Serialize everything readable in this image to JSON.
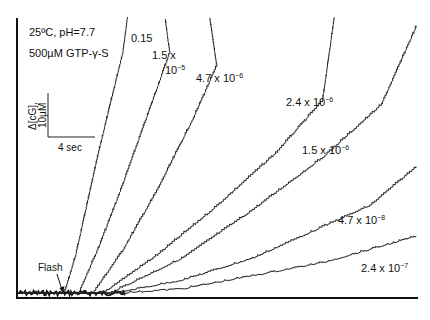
{
  "chart_data": {
    "type": "line",
    "title": "",
    "annotations": {
      "conditions_line1": "25ºC, pH=7.7",
      "conditions_line2": "500µM GTP-γ-S",
      "flash_label": "Flash",
      "scale_y_label_line1": "Δ[cG],",
      "scale_y_label_line2": "10µM",
      "scale_x_label": "4 sec"
    },
    "scale_bar": {
      "time_s": 4,
      "conc_uM": 10
    },
    "xlabel": "",
    "ylabel": "",
    "x_unit": "s",
    "y_unit": "µM",
    "xlim": [
      0,
      34
    ],
    "ylim": [
      0,
      63
    ],
    "flash_time": 3.8,
    "grid": false,
    "legend": "inline labels",
    "series": [
      {
        "name": "0.15",
        "label": "0.15",
        "label_sup": "",
        "start_time": 4.0,
        "points": [
          [
            4.0,
            0
          ],
          [
            5.0,
            9
          ],
          [
            6.0,
            21
          ],
          [
            7.0,
            33
          ],
          [
            8.0,
            44
          ],
          [
            9.0,
            55
          ],
          [
            9.4,
            63
          ]
        ]
      },
      {
        "name": "1.5 x 10^-5",
        "label": "1.5 x",
        "label2": "10",
        "label_sup": "−5",
        "start_time": 5.2,
        "points": [
          [
            5.2,
            0
          ],
          [
            7.0,
            11
          ],
          [
            9.0,
            25
          ],
          [
            11.0,
            40
          ],
          [
            13.0,
            55
          ],
          [
            12.6,
            63
          ]
        ]
      },
      {
        "name": "4.7 x 10^-6",
        "label": "4.7 x 10",
        "label_sup": "−6",
        "start_time": 6.4,
        "points": [
          [
            6.4,
            0
          ],
          [
            9.0,
            10
          ],
          [
            12.0,
            24
          ],
          [
            15.0,
            40
          ],
          [
            17.0,
            52
          ],
          [
            16.4,
            63
          ]
        ]
      },
      {
        "name": "2.4 x 10^-6",
        "label": "2.4 x 10",
        "label_sup": "−6",
        "start_time": 7.2,
        "points": [
          [
            7.2,
            0
          ],
          [
            12.0,
            9
          ],
          [
            17.0,
            20
          ],
          [
            22.0,
            32
          ],
          [
            26.0,
            44
          ],
          [
            27.0,
            63
          ]
        ]
      },
      {
        "name": "1.5 x 10^-6",
        "label": "1.5 x 10",
        "label_sup": "−6",
        "start_time": 7.8,
        "points": [
          [
            7.8,
            0
          ],
          [
            14.0,
            8
          ],
          [
            20.0,
            19
          ],
          [
            26.0,
            31
          ],
          [
            31.0,
            43
          ],
          [
            34.0,
            61
          ]
        ]
      },
      {
        "name": "4.7 x 10^-8",
        "label": "4.7 x 10",
        "label_sup": "−8",
        "start_time": 8.2,
        "points": [
          [
            8.2,
            0
          ],
          [
            14.0,
            3
          ],
          [
            20.0,
            8
          ],
          [
            25.0,
            14
          ],
          [
            30.0,
            20
          ],
          [
            34.0,
            29
          ]
        ]
      },
      {
        "name": "2.4 x 10^-7",
        "label": "2.4 x 10",
        "label_sup": "−7",
        "start_time": 8.6,
        "points": [
          [
            8.6,
            0
          ],
          [
            14.0,
            1
          ],
          [
            20.0,
            4
          ],
          [
            26.0,
            7
          ],
          [
            30.0,
            10
          ],
          [
            34.0,
            13
          ]
        ]
      }
    ]
  }
}
